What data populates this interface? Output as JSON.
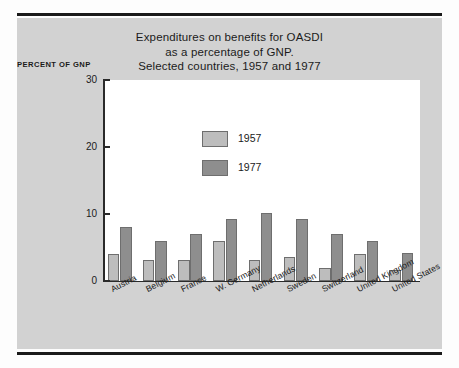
{
  "figure": {
    "title_lines": [
      "Expenditures on benefits for OASDI",
      "as a percentage of GNP.",
      "Selected countries, 1957 and 1977"
    ],
    "title_line_1": "Expenditures on benefits for OASDI",
    "title_line_2": "as a percentage of GNP.",
    "title_line_3": "Selected countries, 1957 and 1977",
    "axis_caption": "PERCENT OF GNP",
    "panel_color": "#d2d2d2",
    "plot_background": "#ffffff",
    "rule_color": "#1a1a1a"
  },
  "legend": {
    "position": "inside-top-center",
    "entries": [
      {
        "label": "1957",
        "color": "#bdbdbd"
      },
      {
        "label": "1977",
        "color": "#8e8e8e"
      }
    ]
  },
  "chart_data": {
    "type": "bar",
    "title": "Expenditures on benefits for OASDI as a percentage of GNP. Selected countries, 1957 and 1977",
    "xlabel": "",
    "ylabel": "PERCENT OF GNP",
    "ylim": [
      0,
      30
    ],
    "yticks": [
      0,
      10,
      20,
      30
    ],
    "ytick_labels": [
      "0",
      "10",
      "20",
      "30"
    ],
    "grid": false,
    "legend_position": "inside-top-center",
    "categories": [
      "Austria",
      "Belgium",
      "France",
      "W. Germany",
      "Netherlands",
      "Sweden",
      "Switzerland",
      "United Kingdom",
      "United States"
    ],
    "series": [
      {
        "name": "1957",
        "color": "#bdbdbd",
        "values": [
          4.0,
          3.2,
          3.1,
          6.0,
          3.1,
          3.6,
          2.0,
          4.1,
          1.6
        ]
      },
      {
        "name": "1977",
        "color": "#8e8e8e",
        "values": [
          8.0,
          6.0,
          7.0,
          9.3,
          10.2,
          9.3,
          7.0,
          6.0,
          4.2
        ]
      }
    ]
  }
}
